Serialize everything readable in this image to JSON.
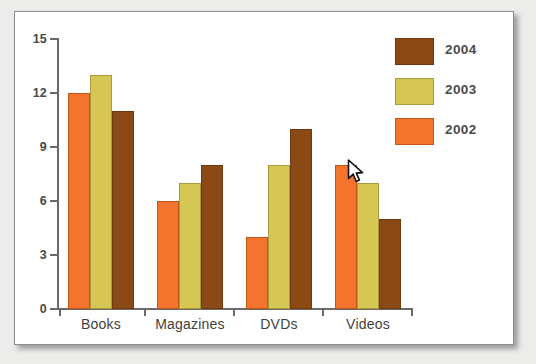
{
  "chart_data": {
    "type": "bar",
    "title": "",
    "subtitle": "",
    "xlabel": "",
    "ylabel": "",
    "categories": [
      "Books",
      "Magazines",
      "DVDs",
      "Videos"
    ],
    "series": [
      {
        "name": "2002",
        "color": "#f2742d",
        "values": [
          12,
          6,
          4,
          8
        ]
      },
      {
        "name": "2003",
        "color": "#d6c755",
        "values": [
          13,
          7,
          8,
          7
        ]
      },
      {
        "name": "2004",
        "color": "#8b4a15",
        "values": [
          11,
          8,
          10,
          5
        ]
      }
    ],
    "ylim": [
      0,
      15
    ],
    "yticks": [
      0,
      3,
      6,
      9,
      12,
      15
    ],
    "ytick_labels": [
      "0",
      "3",
      "6",
      "9",
      "12",
      "15"
    ],
    "grid": false,
    "legend_position": "top-right",
    "legend_order": [
      "2004",
      "2003",
      "2002"
    ],
    "bar_order_in_group": [
      "2002",
      "2003",
      "2004"
    ]
  },
  "legend": {
    "entries": [
      {
        "label": "2004",
        "color": "#8b4a15"
      },
      {
        "label": "2003",
        "color": "#d6c755"
      },
      {
        "label": "2002",
        "color": "#f2742d"
      }
    ]
  },
  "axes": {
    "y_ticks": [
      "15",
      "12",
      "9",
      "6",
      "3",
      "0"
    ],
    "x_categories": [
      "Books",
      "Magazines",
      "DVDs",
      "Videos"
    ]
  },
  "cursor": {
    "icon": "arrow-pointer-icon",
    "x": 348,
    "y": 170
  },
  "colors": {
    "series_2002": "#f2742d",
    "series_2003": "#d6c755",
    "series_2004": "#8b4a15",
    "axis": "#6b6a68",
    "text": "#4a4a48",
    "card_background": "#ffffff",
    "page_background": "#ececeb"
  }
}
